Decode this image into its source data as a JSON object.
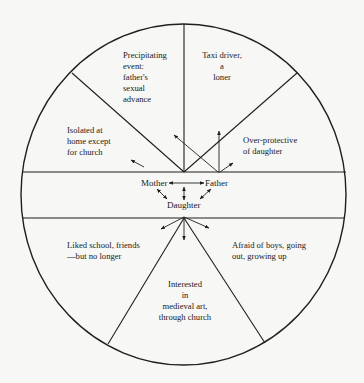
{
  "diagram": {
    "type": "circular-segment family diagram",
    "colors": {
      "line": "#1f1f1f",
      "background": "#f7f7f5",
      "text": "#1a1a1a"
    },
    "center_nodes": {
      "mother": "Mother",
      "father": "Father",
      "daughter": "Daughter"
    },
    "segments": {
      "top_left": "Precipitating\nevent:\nfather's\nsexual\nadvance",
      "top_right": "Taxi driver,\na\nloner",
      "left_upper": "Isolated at\nhome except\nfor church",
      "right_upper": "Over-protective\nof daughter",
      "bottom_left": "Liked school, friends\n—but no longer",
      "bottom_right": "Afraid of boys, going\nout, growing up",
      "bottom_center": "Interested\nin\nmedieval art,\nthrough church"
    },
    "relations": [
      {
        "from": "Mother",
        "to": "Father",
        "type": "bidirectional"
      },
      {
        "from": "Mother",
        "to": "Daughter",
        "type": "bidirectional"
      },
      {
        "from": "Father",
        "to": "Daughter",
        "type": "bidirectional"
      },
      {
        "from": "Daughter",
        "to": "upper-band",
        "type": "bidirectional"
      },
      {
        "from": "Mother",
        "to": "Isolated at home except for church",
        "type": "arrow"
      },
      {
        "from": "Father",
        "to": "Precipitating event",
        "type": "arrow"
      },
      {
        "from": "Father",
        "to": "Taxi driver, a loner",
        "type": "arrow"
      },
      {
        "from": "Father",
        "to": "Over-protective of daughter",
        "type": "arrow"
      },
      {
        "from": "Daughter",
        "to": "Liked school, friends",
        "type": "arrow"
      },
      {
        "from": "Daughter",
        "to": "Interested in medieval art",
        "type": "arrow"
      },
      {
        "from": "Daughter",
        "to": "Afraid of boys",
        "type": "arrow"
      }
    ]
  }
}
